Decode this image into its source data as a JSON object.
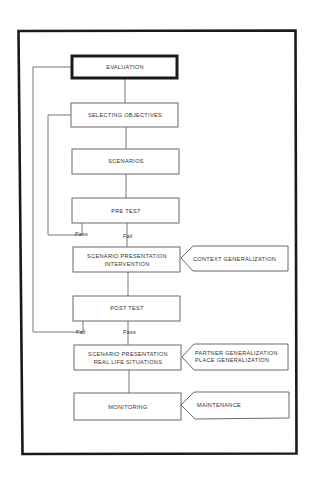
{
  "diagram": {
    "nodes": [
      {
        "id": "evaluation",
        "lines": [
          "EVALUATION"
        ],
        "emphasis": "bold"
      },
      {
        "id": "selecting-objectives",
        "lines": [
          "SELECTING OBJECTIVES"
        ]
      },
      {
        "id": "scenarios",
        "lines": [
          "SCENARIOS"
        ]
      },
      {
        "id": "pre-test",
        "lines": [
          "PRE TEST"
        ]
      },
      {
        "id": "scenario-intervention",
        "lines": [
          "SCENARIO PRESENTATION",
          "INTERVENTION"
        ]
      },
      {
        "id": "post-test",
        "lines": [
          "POST TEST"
        ]
      },
      {
        "id": "scenario-real-life",
        "lines": [
          "SCENARIO PRESENTATION",
          "REAL LIFE SITUATIONS"
        ]
      },
      {
        "id": "monitoring",
        "lines": [
          "MONITORING"
        ]
      }
    ],
    "side_inputs": [
      {
        "id": "context-generalization",
        "lines": [
          "CONTEXT GENERALIZATION"
        ],
        "target": "scenario-intervention"
      },
      {
        "id": "partner-place-generalization",
        "lines": [
          "PARTNER GENERALIZATION",
          "PLACE GENERALIZATION"
        ],
        "target": "scenario-real-life"
      },
      {
        "id": "maintenance",
        "lines": [
          "MAINTENANCE"
        ],
        "target": "monitoring"
      }
    ],
    "branch_labels": {
      "pre_test_pass": "Pass",
      "pre_test_fail": "Fail",
      "post_test_fail": "Fail",
      "post_test_pass": "Pass"
    },
    "edges": [
      {
        "from": "evaluation",
        "to": "selecting-objectives"
      },
      {
        "from": "selecting-objectives",
        "to": "scenarios"
      },
      {
        "from": "scenarios",
        "to": "pre-test"
      },
      {
        "from": "pre-test",
        "to": "selecting-objectives",
        "label": "Pass"
      },
      {
        "from": "pre-test",
        "to": "scenario-intervention",
        "label": "Fail"
      },
      {
        "from": "scenario-intervention",
        "to": "post-test"
      },
      {
        "from": "post-test",
        "to": "evaluation",
        "label": "Fail"
      },
      {
        "from": "post-test",
        "to": "scenario-real-life",
        "label": "Pass"
      },
      {
        "from": "scenario-real-life",
        "to": "monitoring"
      }
    ]
  }
}
